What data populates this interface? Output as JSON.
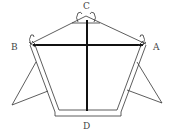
{
  "diagram": {
    "type": "kite-frame",
    "labels": {
      "top": "C",
      "left": "B",
      "right": "A",
      "bottom": "D"
    },
    "colors": {
      "line": "#333333",
      "spar": "#111111",
      "label": "#444444",
      "background": "#ffffff"
    }
  }
}
